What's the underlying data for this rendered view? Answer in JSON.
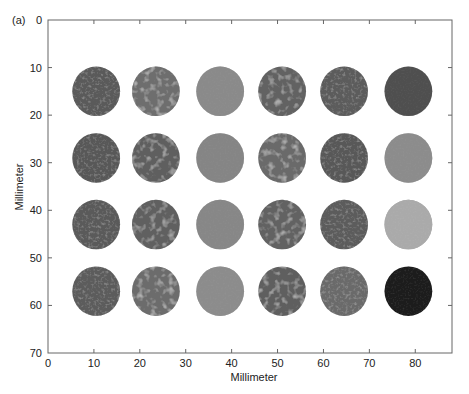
{
  "panel_label": "(a)",
  "chart_data": {
    "type": "heatmap",
    "title": "",
    "xlabel": "Millimeter",
    "ylabel": "Millimeter",
    "xlim": [
      0,
      88
    ],
    "ylim": [
      70,
      0
    ],
    "x_ticks": [
      0,
      10,
      20,
      30,
      40,
      50,
      60,
      70,
      80
    ],
    "y_ticks": [
      0,
      10,
      20,
      30,
      40,
      50,
      60,
      70
    ],
    "grid": false,
    "circle_radius_mm": 5.2,
    "column_centers_mm": [
      10.5,
      23.5,
      37.5,
      51,
      64.5,
      78.5
    ],
    "row_centers_mm": [
      15,
      29,
      43,
      57
    ],
    "circles": [
      {
        "row": 0,
        "col": 0,
        "texture": "fine",
        "base": "#5a5a5a"
      },
      {
        "row": 0,
        "col": 1,
        "texture": "coarse",
        "base": "#6e6e6e"
      },
      {
        "row": 0,
        "col": 2,
        "texture": "smooth",
        "base": "#8a8a8a"
      },
      {
        "row": 0,
        "col": 3,
        "texture": "coarse",
        "base": "#626262"
      },
      {
        "row": 0,
        "col": 4,
        "texture": "fine",
        "base": "#5c5c5c"
      },
      {
        "row": 0,
        "col": 5,
        "texture": "smooth",
        "base": "#505050"
      },
      {
        "row": 1,
        "col": 0,
        "texture": "fine",
        "base": "#585858"
      },
      {
        "row": 1,
        "col": 1,
        "texture": "coarse",
        "base": "#5e5e5e"
      },
      {
        "row": 1,
        "col": 2,
        "texture": "smooth",
        "base": "#858585"
      },
      {
        "row": 1,
        "col": 3,
        "texture": "coarse",
        "base": "#6a6a6a"
      },
      {
        "row": 1,
        "col": 4,
        "texture": "fine",
        "base": "#585858"
      },
      {
        "row": 1,
        "col": 5,
        "texture": "smooth",
        "base": "#8c8c8c"
      },
      {
        "row": 2,
        "col": 0,
        "texture": "fine",
        "base": "#5a5a5a"
      },
      {
        "row": 2,
        "col": 1,
        "texture": "coarse",
        "base": "#606060"
      },
      {
        "row": 2,
        "col": 2,
        "texture": "smooth",
        "base": "#878787"
      },
      {
        "row": 2,
        "col": 3,
        "texture": "coarse",
        "base": "#626262"
      },
      {
        "row": 2,
        "col": 4,
        "texture": "fine",
        "base": "#5c5c5c"
      },
      {
        "row": 2,
        "col": 5,
        "texture": "smooth",
        "base": "#aaaaaa"
      },
      {
        "row": 3,
        "col": 0,
        "texture": "fine",
        "base": "#5c5c5c"
      },
      {
        "row": 3,
        "col": 1,
        "texture": "coarse",
        "base": "#6c6c6c"
      },
      {
        "row": 3,
        "col": 2,
        "texture": "smooth",
        "base": "#8c8c8c"
      },
      {
        "row": 3,
        "col": 3,
        "texture": "coarse",
        "base": "#5e5e5e"
      },
      {
        "row": 3,
        "col": 4,
        "texture": "fine",
        "base": "#6a6a6a"
      },
      {
        "row": 3,
        "col": 5,
        "texture": "smooth",
        "base": "#1a1a1a"
      }
    ]
  }
}
